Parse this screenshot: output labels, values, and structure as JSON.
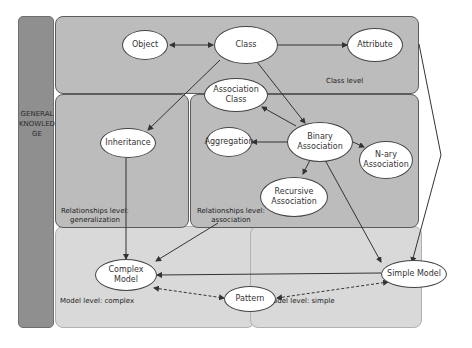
{
  "side_band": {
    "label": "GENERAL  KNOWLEDGE"
  },
  "regions": {
    "class_level": {
      "label": "Class level"
    },
    "rel_generalization": {
      "label": "Relationships level:\ngeneralization"
    },
    "rel_association": {
      "label": "Relationships level:\nassociation"
    },
    "model_complex": {
      "label": "Model level: complex"
    },
    "model_simple": {
      "label": "Model level: simple"
    }
  },
  "nodes": {
    "object": "Object",
    "class": "Class",
    "attribute": "Attribute",
    "association_class": "Association Class",
    "inheritance": "Inheritance",
    "aggregation": "Aggregation",
    "binary_association": "Binary Association",
    "nary_association": "N-ary Association",
    "recursive_association": "Recursive Association",
    "complex_model": "Complex Model",
    "simple_model": "Simple Model",
    "pattern": "Pattern"
  },
  "colors": {
    "dark_region": "#bcbcbc",
    "light_region": "#d9d9d9",
    "band": "#8f8f8f",
    "node_fill": "#ffffff"
  }
}
